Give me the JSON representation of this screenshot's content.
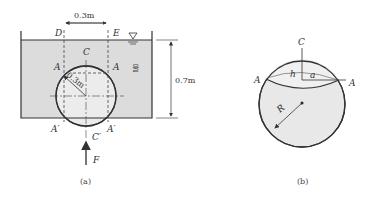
{
  "figure_a": {
    "caption": "(a)",
    "labels": {
      "D": "D",
      "E": "E",
      "C": "C",
      "A_left": "A",
      "A_right": "A",
      "A_prime_left": "A′",
      "A_prime_right": "A′",
      "C_prime": "C′",
      "F": "F",
      "water": "물"
    },
    "dimensions": {
      "width_DE": "0.3m",
      "radius": "0.3m",
      "depth": "0.7m"
    },
    "icons": {
      "free_surface": "water-surface-triangle-icon"
    },
    "colors": {
      "water": "#dcdcdc",
      "sphere": "#ececec",
      "line": "#333333"
    }
  },
  "figure_b": {
    "caption": "(b)",
    "labels": {
      "C": "C",
      "A_left": "A",
      "A_right": "A",
      "h": "h",
      "a": "a",
      "R": "R"
    },
    "colors": {
      "sphere": "#e8e8e8",
      "line": "#333333"
    }
  }
}
